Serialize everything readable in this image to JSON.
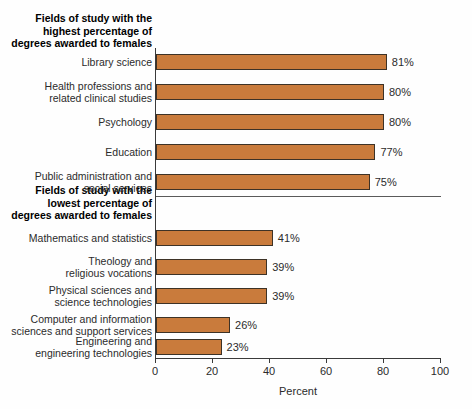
{
  "chart_data": {
    "type": "bar",
    "orientation": "horizontal",
    "title": "",
    "xlabel": "Percent",
    "ylabel": "",
    "xlim": [
      0,
      100
    ],
    "xticks": [
      0,
      20,
      40,
      60,
      80,
      100
    ],
    "xtick_labels": [
      "0",
      "20",
      "40",
      "60",
      "80",
      "100"
    ],
    "grid": false,
    "legend": "none",
    "bar_color": "#C97B3C",
    "bar_edge_color": "#3d3226",
    "groups": [
      {
        "header_lines": [
          "Fields of study with the",
          "highest percentage of",
          "degrees awarded to females"
        ],
        "categories": [
          "Library science",
          "Health professions and related clinical studies",
          "Psychology",
          "Education",
          "Public administration and social services"
        ],
        "category_lines": [
          [
            "Library science"
          ],
          [
            "Health professions and",
            "related clinical studies"
          ],
          [
            "Psychology"
          ],
          [
            "Education"
          ],
          [
            "Public administration and",
            "social services"
          ]
        ],
        "values": [
          81,
          80,
          80,
          77,
          75
        ],
        "value_labels": [
          "81%",
          "80%",
          "80%",
          "77%",
          "75%"
        ]
      },
      {
        "header_lines": [
          "Fields of study with the",
          "lowest percentage of",
          "degrees awarded to females"
        ],
        "categories": [
          "Mathematics and statistics",
          "Theology and religious vocations",
          "Physical sciences and science technologies",
          "Computer and information sciences and support services",
          "Engineering and engineering technologies"
        ],
        "category_lines": [
          [
            "Mathematics and statistics"
          ],
          [
            "Theology and",
            "religious vocations"
          ],
          [
            "Physical sciences and",
            "science technologies"
          ],
          [
            "Computer and information",
            "sciences and support services"
          ],
          [
            "Engineering and",
            "engineering technologies"
          ]
        ],
        "values": [
          41,
          39,
          39,
          26,
          23
        ],
        "value_labels": [
          "41%",
          "39%",
          "39%",
          "26%",
          "23%"
        ]
      }
    ]
  }
}
